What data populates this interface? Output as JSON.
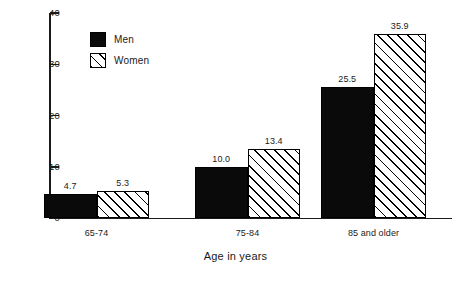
{
  "chart_data": {
    "type": "bar",
    "title": "",
    "subtitle": "",
    "xlabel": "Age in years",
    "ylabel": "",
    "categories": [
      "65-74",
      "75-84",
      "85 and older"
    ],
    "series": [
      {
        "name": "Men",
        "values": [
          4.7,
          10.0,
          25.5
        ],
        "fill": "solid-black",
        "color": "#0a0a0a"
      },
      {
        "name": "Women",
        "values": [
          5.3,
          13.4,
          35.9
        ],
        "fill": "diagonal-hatch",
        "color": "#ffffff"
      }
    ],
    "value_labels": {
      "Men": [
        "4.7",
        "10.0",
        "25.5"
      ],
      "Women": [
        "5.3",
        "13.4",
        "35.9"
      ]
    },
    "ylim": [
      0,
      40
    ],
    "yticks": [
      0,
      10,
      20,
      30,
      40
    ],
    "ytick_labels": [
      "0",
      "10",
      "20",
      "30",
      "40"
    ],
    "grid": false,
    "legend": {
      "position": "top-left-inside",
      "entries": [
        {
          "label": "Men",
          "swatch": "solid-black-swatch"
        },
        {
          "label": "Women",
          "swatch": "diagonal-hatch-swatch"
        }
      ]
    },
    "axis_style": {
      "frame": "left-and-bottom-only",
      "tick_direction": "inward"
    }
  }
}
